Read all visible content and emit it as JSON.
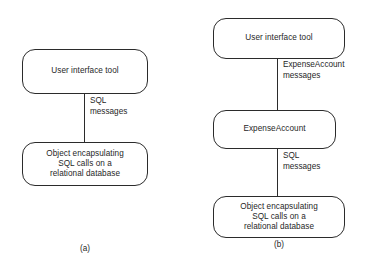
{
  "figure": {
    "background_color": "#ffffff",
    "stroke_color": "#2b2b2b",
    "text_color": "#1f1f1f"
  },
  "panel_a": {
    "caption": "(a)",
    "nodes": [
      {
        "id": "user-interface-tool",
        "label": "User interface tool"
      },
      {
        "id": "sql-wrapper",
        "label": "Object encapsulating\nSQL calls on a\nrelational database"
      }
    ],
    "edges": [
      {
        "id": "ui-to-db",
        "from": "user-interface-tool",
        "to": "sql-wrapper",
        "label": "SQL\nmessages"
      }
    ]
  },
  "panel_b": {
    "caption": "(b)",
    "nodes": [
      {
        "id": "user-interface-tool",
        "label": "User interface tool"
      },
      {
        "id": "expense-account",
        "label": "ExpenseAccount"
      },
      {
        "id": "sql-wrapper",
        "label": "Object encapsulating\nSQL calls on a\nrelational database"
      }
    ],
    "edges": [
      {
        "id": "ui-to-expense",
        "from": "user-interface-tool",
        "to": "expense-account",
        "label": "ExpenseAccount\nmessages"
      },
      {
        "id": "expense-to-db",
        "from": "expense-account",
        "to": "sql-wrapper",
        "label": "SQL\nmessages"
      }
    ]
  }
}
